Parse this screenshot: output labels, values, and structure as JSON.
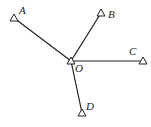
{
  "diagram": {
    "center": {
      "label": "O",
      "x": 71,
      "y": 61,
      "label_x": 75,
      "label_y": 72
    },
    "points": [
      {
        "label": "A",
        "x": 14,
        "y": 18,
        "label_x": 19,
        "label_y": 14
      },
      {
        "label": "B",
        "x": 101,
        "y": 13,
        "label_x": 108,
        "label_y": 18
      },
      {
        "label": "C",
        "x": 143,
        "y": 61,
        "label_x": 129,
        "label_y": 55
      },
      {
        "label": "D",
        "x": 82,
        "y": 113,
        "label_x": 86,
        "label_y": 110
      }
    ],
    "stroke_color": "#222222"
  }
}
